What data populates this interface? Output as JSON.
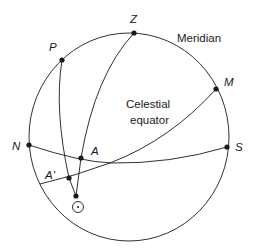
{
  "diagram": {
    "type": "celestial-sphere",
    "labels": {
      "Z": "Z",
      "P": "P",
      "M": "M",
      "N": "N",
      "S": "S",
      "A": "A",
      "A_prime": "A'",
      "meridian": "Meridian",
      "celestial_equator_line1": "Celestial",
      "celestial_equator_line2": "equator"
    },
    "points": {
      "Z": [
        134,
        33
      ],
      "P": [
        62,
        60
      ],
      "M": [
        216,
        89
      ],
      "N": [
        29,
        145
      ],
      "S": [
        227,
        147
      ],
      "A": [
        81,
        158
      ],
      "A_prime": [
        69,
        178
      ],
      "sun_position": [
        76,
        196
      ]
    },
    "sun_symbol": "sun-symbol",
    "colors": {
      "stroke": "#1a1a1a",
      "background": "#ffffff"
    }
  }
}
